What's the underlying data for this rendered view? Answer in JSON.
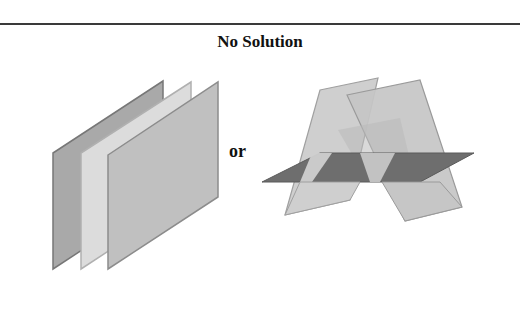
{
  "title": "No Solution",
  "connector": "or",
  "figures": [
    {
      "name": "three-parallel-planes",
      "description": "Three parallel planes, no common intersection",
      "planes": [
        {
          "label": "back",
          "fill": "#a9a9a9",
          "stroke": "#777777"
        },
        {
          "label": "middle",
          "fill": "#dcdcdc",
          "stroke": "#b0b0b0"
        },
        {
          "label": "front",
          "fill": "#c0c0c0",
          "stroke": "#8c8c8c"
        }
      ]
    },
    {
      "name": "three-planes-pairwise-intersecting",
      "description": "Three planes intersecting pairwise in three parallel lines, no common point",
      "planes": [
        {
          "label": "horizontal",
          "fill": "#6e6e6e",
          "stroke": "#5a5a5a"
        },
        {
          "label": "tilted-left",
          "fill": "#cfcfcf",
          "stroke": "#a0a0a0"
        },
        {
          "label": "tilted-right",
          "fill": "#c6c6c6",
          "stroke": "#9a9a9a"
        }
      ]
    }
  ],
  "colors": {
    "rule": "#3a3a3a",
    "text": "#111111",
    "background": "#ffffff"
  }
}
